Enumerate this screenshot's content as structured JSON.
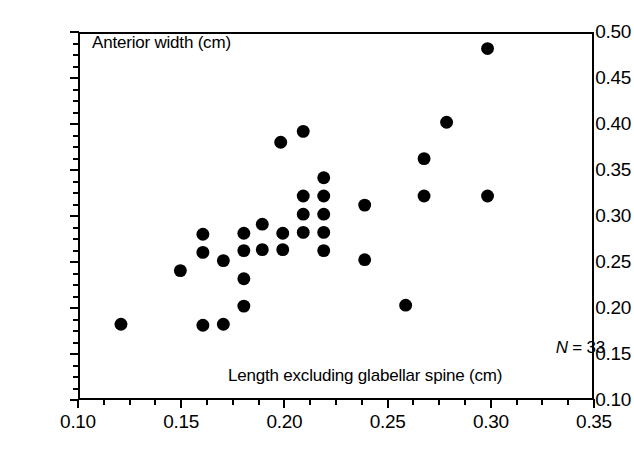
{
  "chart_data": {
    "type": "scatter",
    "title": "",
    "xlabel": "Length excluding glabellar spine (cm)",
    "ylabel": "Anterior width (cm)",
    "xlim": [
      0.1,
      0.35
    ],
    "ylim": [
      0.1,
      0.5
    ],
    "xticks": [
      0.1,
      0.15,
      0.2,
      0.25,
      0.3,
      0.35
    ],
    "yticks": [
      0.1,
      0.15,
      0.2,
      0.25,
      0.3,
      0.35,
      0.4,
      0.45,
      0.5
    ],
    "xtick_labels": [
      "0.10",
      "0.15",
      "0.20",
      "0.25",
      "0.30",
      "0.35"
    ],
    "ytick_labels": [
      "0.10",
      "0.15",
      "0.20",
      "0.25",
      "0.30",
      "0.35",
      "0.40",
      "0.45",
      "0.50"
    ],
    "xtick_minor_step": 0.0125,
    "ytick_minor_step": 0.0125,
    "grid": false,
    "legend": null,
    "marker": "filled-circle",
    "marker_color": "#000000",
    "marker_size_px": 13,
    "annotation": "N = 33",
    "n_points": 33,
    "x": [
      0.12,
      0.149,
      0.16,
      0.16,
      0.16,
      0.17,
      0.17,
      0.18,
      0.18,
      0.18,
      0.18,
      0.189,
      0.189,
      0.198,
      0.199,
      0.199,
      0.209,
      0.209,
      0.209,
      0.209,
      0.219,
      0.219,
      0.219,
      0.219,
      0.219,
      0.239,
      0.239,
      0.259,
      0.268,
      0.268,
      0.279,
      0.299,
      0.299
    ],
    "y": [
      0.181,
      0.24,
      0.28,
      0.26,
      0.18,
      0.251,
      0.181,
      0.281,
      0.262,
      0.231,
      0.201,
      0.291,
      0.263,
      0.381,
      0.281,
      0.263,
      0.393,
      0.322,
      0.302,
      0.282,
      0.342,
      0.322,
      0.302,
      0.282,
      0.262,
      0.312,
      0.252,
      0.202,
      0.363,
      0.322,
      0.403,
      0.484,
      0.322
    ],
    "points": [
      {
        "x": 0.12,
        "y": 0.181
      },
      {
        "x": 0.149,
        "y": 0.24
      },
      {
        "x": 0.16,
        "y": 0.28
      },
      {
        "x": 0.16,
        "y": 0.26
      },
      {
        "x": 0.16,
        "y": 0.18
      },
      {
        "x": 0.17,
        "y": 0.251
      },
      {
        "x": 0.17,
        "y": 0.181
      },
      {
        "x": 0.18,
        "y": 0.281
      },
      {
        "x": 0.18,
        "y": 0.262
      },
      {
        "x": 0.18,
        "y": 0.231
      },
      {
        "x": 0.18,
        "y": 0.201
      },
      {
        "x": 0.189,
        "y": 0.291
      },
      {
        "x": 0.189,
        "y": 0.263
      },
      {
        "x": 0.198,
        "y": 0.381
      },
      {
        "x": 0.199,
        "y": 0.281
      },
      {
        "x": 0.199,
        "y": 0.263
      },
      {
        "x": 0.209,
        "y": 0.393
      },
      {
        "x": 0.209,
        "y": 0.322
      },
      {
        "x": 0.209,
        "y": 0.302
      },
      {
        "x": 0.209,
        "y": 0.282
      },
      {
        "x": 0.219,
        "y": 0.342
      },
      {
        "x": 0.219,
        "y": 0.322
      },
      {
        "x": 0.219,
        "y": 0.302
      },
      {
        "x": 0.219,
        "y": 0.282
      },
      {
        "x": 0.219,
        "y": 0.262
      },
      {
        "x": 0.239,
        "y": 0.312
      },
      {
        "x": 0.239,
        "y": 0.252
      },
      {
        "x": 0.259,
        "y": 0.202
      },
      {
        "x": 0.268,
        "y": 0.363
      },
      {
        "x": 0.268,
        "y": 0.322
      },
      {
        "x": 0.279,
        "y": 0.403
      },
      {
        "x": 0.299,
        "y": 0.484
      },
      {
        "x": 0.299,
        "y": 0.322
      }
    ]
  },
  "annotations": {
    "y_axis_title": "Anterior width (cm)",
    "x_axis_title": "Length excluding glabellar spine (cm)",
    "sample_size_symbol": "N",
    "sample_size_value": "= 33"
  }
}
